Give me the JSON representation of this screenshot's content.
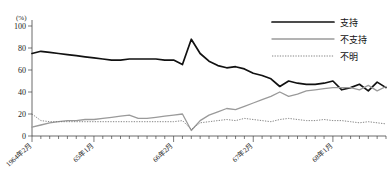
{
  "chart_data": {
    "type": "line",
    "title": "",
    "xlabel": "",
    "ylabel": "(%)",
    "ylim": [
      0,
      100
    ],
    "yticks": [
      0,
      20,
      40,
      60,
      80,
      100
    ],
    "grid": false,
    "legend_position": "top-right",
    "xtick_labels": [
      "1964年2月",
      "65年1月",
      "66年2月",
      "67年2月",
      "68年1月"
    ],
    "xtick_positions": [
      0,
      7,
      16,
      25,
      34
    ],
    "x_count": 41,
    "series": [
      {
        "name": "支持",
        "style": "solid-thick",
        "color": "#111111",
        "values": [
          75,
          77,
          76,
          75,
          74,
          73,
          72,
          71,
          70,
          69,
          69,
          70,
          70,
          70,
          70,
          69,
          69,
          65,
          88,
          75,
          68,
          64,
          62,
          63,
          61,
          57,
          55,
          52,
          45,
          50,
          48,
          47,
          47,
          48,
          50,
          42,
          44,
          47,
          41,
          49,
          44
        ]
      },
      {
        "name": "不支持",
        "style": "solid-thin",
        "color": "#9a9a9a",
        "values": [
          8,
          10,
          12,
          13,
          14,
          14,
          15,
          15,
          16,
          17,
          18,
          19,
          16,
          16,
          17,
          18,
          19,
          20,
          5,
          14,
          19,
          22,
          25,
          24,
          27,
          30,
          33,
          36,
          40,
          36,
          38,
          41,
          42,
          43,
          44,
          44,
          44,
          42,
          46,
          41,
          45
        ]
      },
      {
        "name": "不明",
        "style": "dotted",
        "color": "#777777",
        "values": [
          20,
          14,
          13,
          13,
          13,
          13,
          13,
          13,
          13,
          13,
          13,
          13,
          13,
          13,
          13,
          13,
          13,
          14,
          6,
          12,
          13,
          14,
          15,
          14,
          16,
          15,
          14,
          13,
          15,
          16,
          15,
          14,
          14,
          15,
          14,
          14,
          13,
          12,
          13,
          12,
          11
        ]
      }
    ]
  },
  "legend": {
    "items": [
      {
        "label": "支持"
      },
      {
        "label": "不支持"
      },
      {
        "label": "不明"
      }
    ]
  }
}
